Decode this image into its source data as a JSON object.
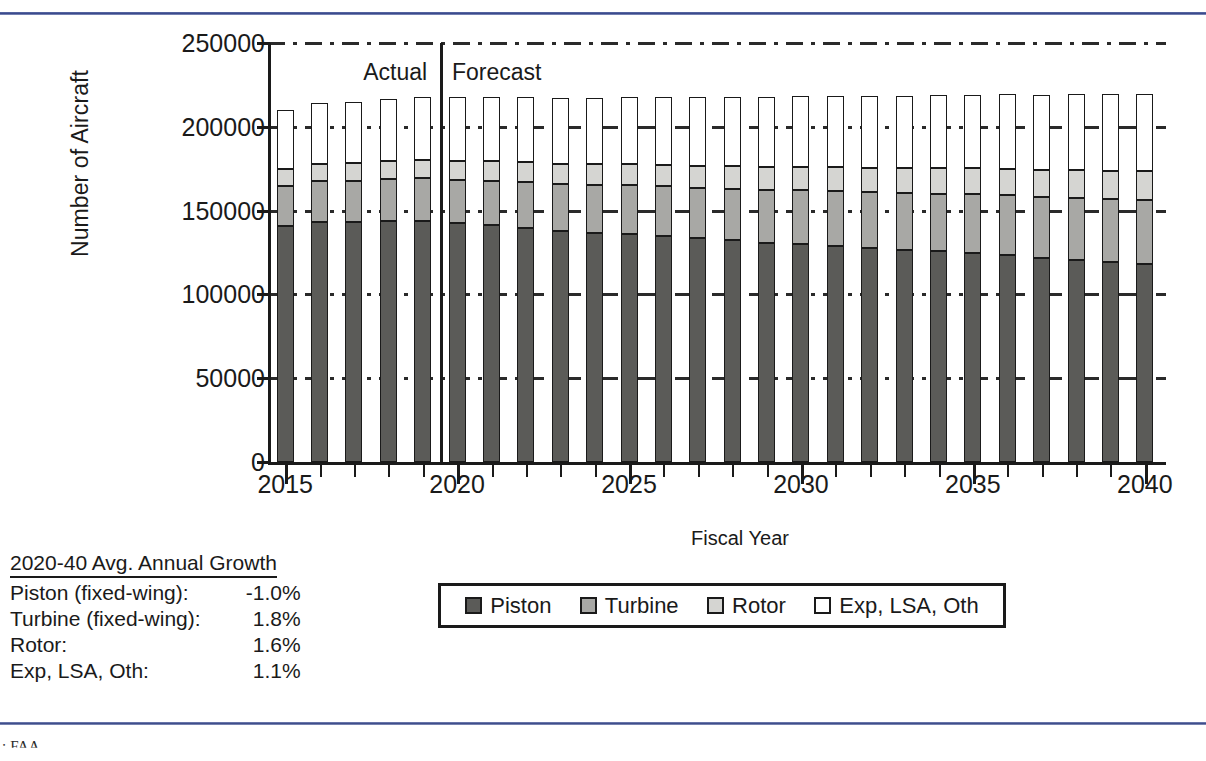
{
  "chart_data": {
    "type": "bar",
    "subtype": "stacked-bar",
    "title": "",
    "xlabel": "Fiscal Year",
    "ylabel": "Number of Aircraft",
    "ylim": [
      0,
      250000
    ],
    "ytick_values": [
      0,
      50000,
      100000,
      150000,
      200000,
      250000
    ],
    "ytick_labels": [
      "0",
      "50000",
      "100000",
      "150000",
      "200000",
      "250000"
    ],
    "xtick_labels": [
      "2015",
      "2020",
      "2025",
      "2030",
      "2035",
      "2040"
    ],
    "grid": true,
    "legend_position": "bottom",
    "categories": [
      2015,
      2016,
      2017,
      2018,
      2019,
      2020,
      2021,
      2022,
      2023,
      2024,
      2025,
      2026,
      2027,
      2028,
      2029,
      2030,
      2031,
      2032,
      2033,
      2034,
      2035,
      2036,
      2037,
      2038,
      2039,
      2040
    ],
    "series": [
      {
        "name": "Piston",
        "color": "#5b5b58",
        "values": [
          140800,
          143200,
          143200,
          143800,
          143800,
          142400,
          141200,
          139800,
          138000,
          136800,
          136000,
          134800,
          133400,
          132200,
          130800,
          130000,
          128800,
          127600,
          126400,
          125600,
          124600,
          123500,
          122000,
          120800,
          119600,
          118400
        ]
      },
      {
        "name": "Turbine",
        "color": "#a8a8a5",
        "values": [
          23800,
          24200,
          24600,
          25000,
          25400,
          26000,
          26600,
          27200,
          27800,
          28400,
          29000,
          29600,
          30200,
          30800,
          31400,
          32000,
          32600,
          33200,
          33800,
          34400,
          35000,
          35600,
          36200,
          36800,
          37400,
          38000
        ]
      },
      {
        "name": "Rotor",
        "color": "#d5d5d2",
        "values": [
          10200,
          10400,
          10600,
          10800,
          11000,
          11200,
          11500,
          11800,
          12000,
          12300,
          12600,
          12900,
          13200,
          13500,
          13800,
          14100,
          14400,
          14700,
          15000,
          15300,
          15600,
          15900,
          16200,
          16500,
          16800,
          17100
        ]
      },
      {
        "name": "Exp, LSA, Oth",
        "color": "#ffffff",
        "values": [
          35200,
          36200,
          36600,
          37000,
          37400,
          38000,
          38400,
          38800,
          39200,
          39600,
          40000,
          40400,
          40800,
          41200,
          41600,
          42000,
          42400,
          42800,
          43200,
          43600,
          44000,
          44400,
          44800,
          45200,
          45600,
          46000
        ]
      }
    ],
    "annotations": [
      {
        "name": "actual-label",
        "text": "Actual",
        "x_year": 2018.2
      },
      {
        "name": "forecast-label",
        "text": "Forecast",
        "x_year": 2020.3
      }
    ],
    "divider": {
      "name": "actual-forecast-divider",
      "x_year": 2019.5
    }
  },
  "growth_table": {
    "heading": "2020-40 Avg. Annual Growth",
    "rows": [
      {
        "label": "Piston (fixed-wing):",
        "value": "-1.0%"
      },
      {
        "label": "Turbine (fixed-wing):",
        "value": "1.8%"
      },
      {
        "label": "Rotor:",
        "value": "1.6%"
      },
      {
        "label": "Exp, LSA, Oth:",
        "value": "1.1%"
      }
    ]
  },
  "legend": {
    "items": [
      {
        "label": "Piston",
        "swatch": "piston"
      },
      {
        "label": "Turbine",
        "swatch": "turbine"
      },
      {
        "label": "Rotor",
        "swatch": "rotor"
      },
      {
        "label": "Exp, LSA, Oth",
        "swatch": "other"
      }
    ]
  },
  "footnote": {
    "text": ": FAA"
  },
  "colors": {
    "rule": "#3b4a8c",
    "piston": "#5b5b58",
    "turbine": "#a8a8a5",
    "rotor": "#d5d5d2",
    "other": "#ffffff",
    "ink": "#1a1a1a"
  }
}
